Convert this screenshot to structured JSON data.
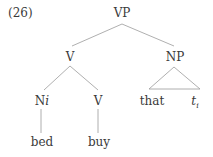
{
  "example_number": "(26)",
  "tree": {
    "root": {
      "label": "VP"
    },
    "v_node": {
      "label": "V"
    },
    "np_node": {
      "label": "NP"
    },
    "n_node": {
      "label": "N",
      "index": "i"
    },
    "v_leaf_node": {
      "label": "V"
    },
    "np_that": {
      "label": "that"
    },
    "np_trace": {
      "label": "t",
      "index": "i"
    },
    "word_bed": {
      "label": "bed"
    },
    "word_buy": {
      "label": "buy"
    }
  },
  "colors": {
    "line": "#9a9a9a",
    "text": "#3a3a3a"
  }
}
